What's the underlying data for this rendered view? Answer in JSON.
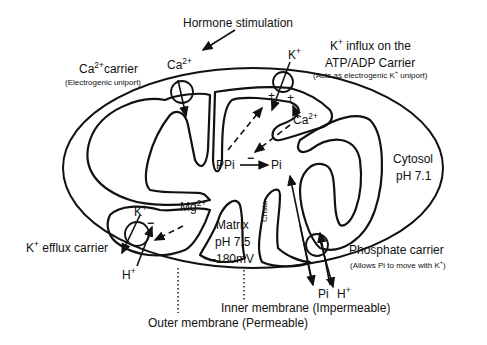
{
  "labels": {
    "hormone": "Hormone stimulation",
    "ca_carrier": "Ca",
    "ca_carrier_sup": "2+",
    "ca_carrier_rest": "carrier",
    "ca_carrier_note": "(Electrogenic uniport)",
    "ca_top": "Ca",
    "ca_top_sup": "2+",
    "k_top": "K",
    "k_top_sup": "+",
    "k_influx_line1_a": "K",
    "k_influx_line1_sup": "+",
    "k_influx_line1_b": " influx on the",
    "k_influx_line2": "ATP/ADP Carrier",
    "k_influx_note_a": "(Acts as electrogenic K",
    "k_influx_note_sup": "+",
    "k_influx_note_b": " uniport)",
    "plus_left": "+",
    "plus_right": "+",
    "ca_inner": "Ca",
    "ca_inner_sup": "2+",
    "ppi": "PPi",
    "pi": "Pi",
    "minus_ppi": "−",
    "cytosol": "Cytosol",
    "cytosol_ph": "pH 7.1",
    "mg": "Mg",
    "mg_sup": "2+",
    "k_inner": "K",
    "k_inner_sup": "+",
    "minus_k": "−",
    "k_efflux_a": "K",
    "k_efflux_sup": "+",
    "k_efflux_b": " efflux carrier",
    "h_left": "H",
    "h_left_sup": "+",
    "matrix": "Matrix",
    "matrix_ph": "pH 7.5",
    "matrix_mv": "-180mV",
    "crista": "Crista",
    "phosphate": "Phosphate carrier",
    "phosphate_note_a": "(Allows Pi to move with K",
    "phosphate_note_sup": "+",
    "phosphate_note_b": ")",
    "pi_bottom": "Pi",
    "h_bottom": "H",
    "h_bottom_sup": "+",
    "inner_membrane": "Inner membrane (Impermeable)",
    "outer_membrane": "Outer membrane (Permeable)"
  }
}
